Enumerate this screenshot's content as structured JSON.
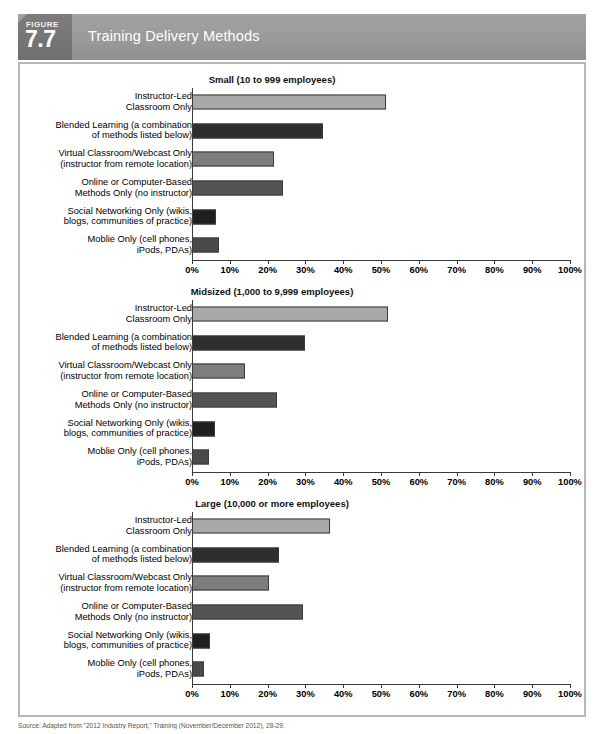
{
  "figure": {
    "badge_word": "FIGURE",
    "badge_number": "7.7",
    "title": "Training Delivery Methods",
    "source": "Source: Adapted from \"2012 Industry Report,\" Training (November/December 2012), 28-29."
  },
  "colors": {
    "header_bar": "#9a9a9a",
    "badge": "#74747 4",
    "panel_border": "#b8b8b8",
    "bar_instructor_led": "#a9a9a9",
    "bar_blended": "#2e2e2e",
    "bar_virtual": "#7d7d7d",
    "bar_online": "#545454",
    "bar_social": "#1f1f1f",
    "bar_mobile": "#4a4a4a",
    "axis": "#3a3a3a"
  },
  "axis": {
    "ticks": [
      "0%",
      "10%",
      "20%",
      "30%",
      "40%",
      "50%",
      "60%",
      "70%",
      "80%",
      "90%",
      "100%"
    ],
    "min": 0,
    "max": 100
  },
  "categories": [
    "Instructor-Led\nClassroom Only",
    "Blended Learning (a combination\nof methods listed below)",
    "Virtual Classroom/Webcast Only\n(instructor from remote location)",
    "Online or Computer-Based\nMethods Only (no instructor)",
    "Social Networking Only (wikis,\nblogs, communities of practice)",
    "Moblie Only (cell phones,\niPods, PDAs)"
  ],
  "chart_data": [
    {
      "type": "bar",
      "title": "Small (10 to 999 employees)",
      "orientation": "horizontal",
      "categories": [
        "Instructor-Led Classroom Only",
        "Blended Learning (a combination of methods listed below)",
        "Virtual Classroom/Webcast Only (instructor from remote location)",
        "Online or Computer-Based Methods Only (no instructor)",
        "Social Networking Only (wikis, blogs, communities of practice)",
        "Moblie Only (cell phones, iPods, PDAs)"
      ],
      "values": [
        51.3,
        34.7,
        21.8,
        24.2,
        6.4,
        7.2
      ],
      "xlabel": "",
      "ylabel": "",
      "xlim": [
        0,
        100
      ],
      "grid": false,
      "legend": "none"
    },
    {
      "type": "bar",
      "title": "Midsized (1,000 to 9,999 employees)",
      "orientation": "horizontal",
      "categories": [
        "Instructor-Led Classroom Only",
        "Blended Learning (a combination of methods listed below)",
        "Virtual Classroom/Webcast Only (instructor from remote location)",
        "Online or Computer-Based Methods Only (no instructor)",
        "Social Networking Only (wikis, blogs, communities of practice)",
        "Moblie Only (cell phones, iPods, PDAs)"
      ],
      "values": [
        51.8,
        29.8,
        14.0,
        22.4,
        6.0,
        4.6
      ],
      "xlabel": "",
      "ylabel": "",
      "xlim": [
        0,
        100
      ],
      "grid": false,
      "legend": "none"
    },
    {
      "type": "bar",
      "title": "Large (10,000 or more employees)",
      "orientation": "horizontal",
      "categories": [
        "Instructor-Led Classroom Only",
        "Blended Learning (a combination of methods listed below)",
        "Virtual Classroom/Webcast Only (instructor from remote location)",
        "Online or Computer-Based Methods Only (no instructor)",
        "Social Networking Only (wikis, blogs, communities of practice)",
        "Moblie Only (cell phones, iPods, PDAs)"
      ],
      "values": [
        36.4,
        23.0,
        20.5,
        29.4,
        4.7,
        3.1
      ],
      "xlabel": "",
      "ylabel": "",
      "xlim": [
        0,
        100
      ],
      "grid": false,
      "legend": "none"
    }
  ]
}
